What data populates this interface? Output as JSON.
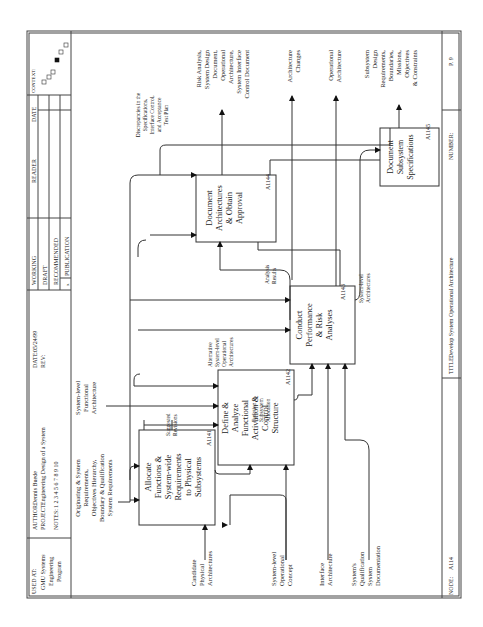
{
  "header": {
    "used_at_label": "USED AT:",
    "used_at_value": [
      "GMU Systems",
      "Engineering",
      "Program"
    ],
    "author_label": "AUTHOR:",
    "author_value": "Dennis Buede",
    "project_label": "PROJECT:",
    "project_value": "Engineering Design of a System",
    "notes_label": "NOTES:",
    "notes_value": "1 2 3 4 5 6 7 8 9 10",
    "date_label": "DATE:",
    "date_value": "05/24/99",
    "rev_label": "REV:",
    "status": [
      "WORKING",
      "DRAFT",
      "RECOMMENDED",
      "PUBLICATION"
    ],
    "status_mark": "x",
    "reader_label": "READER",
    "reader_date_label": "DATE",
    "context_label": "CONTEXT:"
  },
  "footer": {
    "node_label": "NODE:",
    "node_value": "A114",
    "title_label": "TITLE:",
    "title_value": "Develop System Operational Architecture",
    "number_label": "NUMBER:",
    "number_value": "P. 9"
  },
  "boxes": [
    {
      "id": "A1141",
      "lines": [
        "Allocate",
        "Functions &",
        "System-wide",
        "Requirements",
        "to Physical",
        "Subsystems"
      ]
    },
    {
      "id": "A1142",
      "lines": [
        "Define &",
        "Analyze",
        "Functional",
        "Activation &",
        "Control",
        "Structure"
      ]
    },
    {
      "id": "A1143",
      "lines": [
        "Conduct",
        "Performance",
        "& Risk",
        "Analyses"
      ]
    },
    {
      "id": "A1144",
      "lines": [
        "Document",
        "Architectures",
        "& Obtain",
        "Approval"
      ]
    },
    {
      "id": "A1145",
      "lines": [
        "Document",
        "Subsystem",
        "Specifications"
      ]
    }
  ],
  "controls": {
    "originating": [
      "Originating & System",
      "Requirements,",
      "Objectives Hierarchy,",
      "Boundary & Qualification",
      "System Requirements"
    ],
    "functional": [
      "System-level",
      "Functional",
      "Architecture"
    ]
  },
  "inputs": {
    "candidate": [
      "Candidate",
      "Physical",
      "Architectures"
    ],
    "opconcept": [
      "System-level",
      "Operational",
      "Concept"
    ],
    "interface": [
      "Interface",
      "Architecture"
    ],
    "qualification": [
      "System's",
      "Qualification",
      "System",
      "Documentation"
    ]
  },
  "outputs": {
    "risk": [
      "Risk Analysis,",
      "System Design",
      "Document,",
      "Operational",
      "Architecture,",
      "System Interface",
      "Control Document"
    ],
    "changes": [
      "Architecture",
      "Changes"
    ],
    "oparch": [
      "Operational",
      "Architecture"
    ],
    "subsystem": [
      "Subsystem",
      "Design",
      "Requirements,",
      "Boundaries,",
      "Missions,",
      "Objectives",
      "& Constraints"
    ]
  },
  "internal_labels": {
    "discrepancies": [
      "Discrepancies in the",
      "Specifications,",
      "Interface Control,",
      "and Acceptance",
      "Test Plan"
    ],
    "suggested": [
      "Suggested",
      "Revisions"
    ],
    "function_alloc": [
      "Function to",
      "Subsystem",
      "Allocation"
    ],
    "alternative": [
      "Alternative",
      "System-level",
      "Operational",
      "Architectures"
    ],
    "analysis": [
      "Analysis",
      "Results"
    ],
    "syslevel": [
      "System-level",
      "Architectures"
    ]
  }
}
